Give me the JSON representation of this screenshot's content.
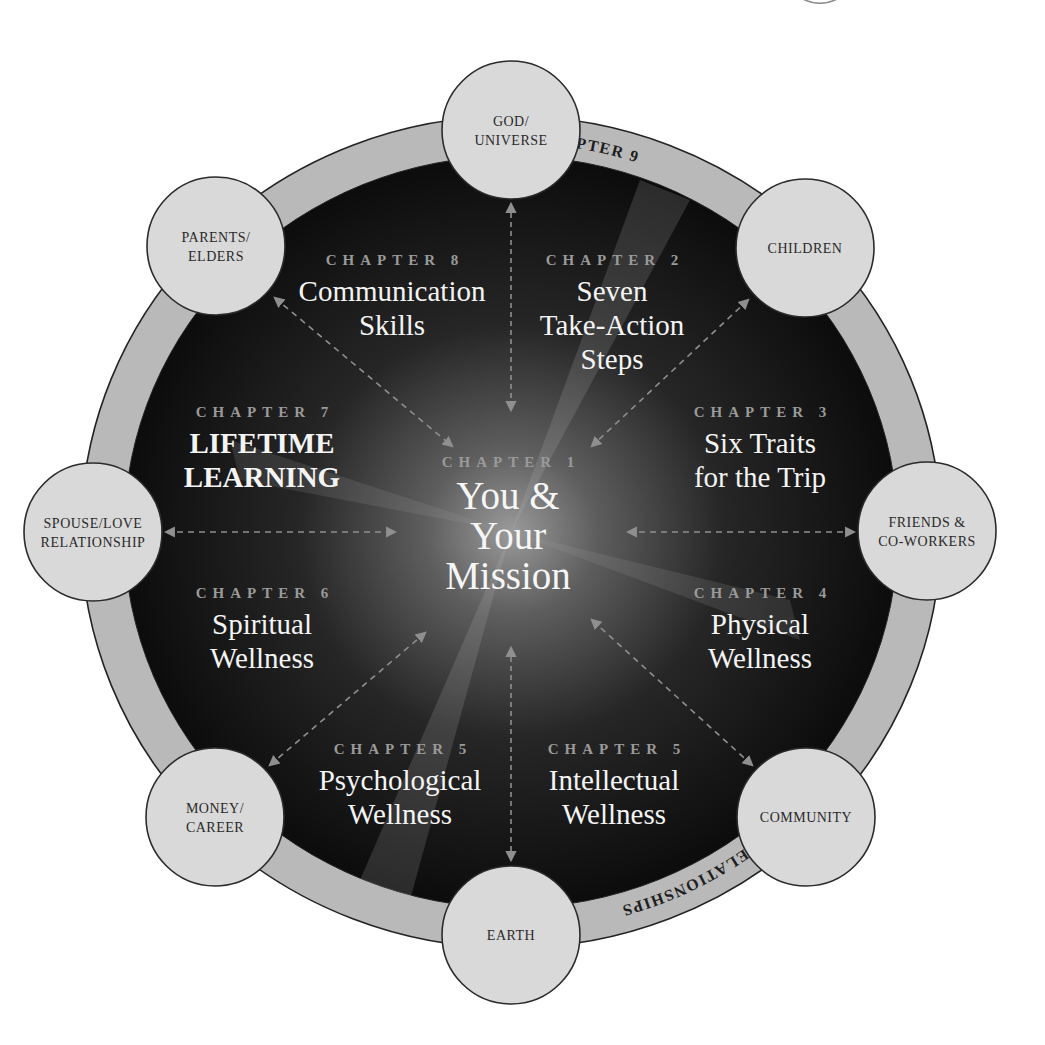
{
  "diagram": {
    "center": {
      "x": 511,
      "y": 532
    },
    "ring": {
      "outer_rx": 430,
      "outer_ry": 416,
      "inner_rx": 387,
      "inner_ry": 376
    },
    "colors": {
      "ring_fill": "#b9b9b9",
      "inner_dark": "#0e0e0e",
      "glow": "#8a8a8a",
      "node_fill": "#d9d9d9",
      "node_stroke": "#2b2b2b",
      "chapter_label": "#9a9a9a",
      "title_text": "#f4f4f4",
      "arrow": "#8f8f8f"
    },
    "arc_labels": [
      {
        "id": "arc-chapter-9",
        "text": "CHAPTER 9",
        "start_pct": "26%"
      },
      {
        "id": "arc-relationships",
        "text": "RELATIONSHIPS",
        "start_pct": "64.5%"
      }
    ],
    "nodes": [
      {
        "id": "god-universe",
        "lines": [
          "GOD/",
          "UNIVERSE"
        ],
        "x": 511,
        "y": 130
      },
      {
        "id": "children",
        "lines": [
          "CHILDREN"
        ],
        "x": 805,
        "y": 248
      },
      {
        "id": "friends-coworkers",
        "lines": [
          "FRIENDS &",
          "CO-WORKERS"
        ],
        "x": 927,
        "y": 531
      },
      {
        "id": "community",
        "lines": [
          "COMMUNITY"
        ],
        "x": 806,
        "y": 817
      },
      {
        "id": "earth",
        "lines": [
          "EARTH"
        ],
        "x": 511,
        "y": 935
      },
      {
        "id": "money-career",
        "lines": [
          "MONEY/",
          "CAREER"
        ],
        "x": 215,
        "y": 817
      },
      {
        "id": "spouse-love-relationship",
        "lines": [
          "SPOUSE/LOVE",
          "RELATIONSHIP"
        ],
        "x": 93,
        "y": 532
      },
      {
        "id": "parents-elders",
        "lines": [
          "PARENTS/",
          "ELDERS"
        ],
        "x": 216,
        "y": 246
      }
    ],
    "node_radius": 69,
    "chapters": [
      {
        "id": "chapter-8",
        "label": "CHAPTER 8",
        "lines": [
          "Communication",
          "Skills"
        ],
        "x": 392,
        "y": 265,
        "bold": false
      },
      {
        "id": "chapter-2",
        "label": "CHAPTER 2",
        "lines": [
          "Seven",
          "Take-Action",
          "Steps"
        ],
        "x": 612,
        "y": 265,
        "bold": false
      },
      {
        "id": "chapter-7",
        "label": "CHAPTER 7",
        "lines": [
          "LIFETIME",
          "LEARNING"
        ],
        "x": 262,
        "y": 417,
        "bold": true
      },
      {
        "id": "chapter-3",
        "label": "CHAPTER 3",
        "lines": [
          "Six Traits",
          "for the Trip"
        ],
        "x": 760,
        "y": 417,
        "bold": false
      },
      {
        "id": "chapter-6",
        "label": "CHAPTER 6",
        "lines": [
          "Spiritual",
          "Wellness"
        ],
        "x": 262,
        "y": 598,
        "bold": false
      },
      {
        "id": "chapter-4",
        "label": "CHAPTER 4",
        "lines": [
          "Physical",
          "Wellness"
        ],
        "x": 760,
        "y": 598,
        "bold": false
      },
      {
        "id": "chapter-5-psych",
        "label": "CHAPTER 5",
        "lines": [
          "Psychological",
          "Wellness"
        ],
        "x": 400,
        "y": 754,
        "bold": false
      },
      {
        "id": "chapter-5-intel",
        "label": "CHAPTER 5",
        "lines": [
          "Intellectual",
          "Wellness"
        ],
        "x": 614,
        "y": 754,
        "bold": false
      }
    ],
    "center_chapter": {
      "id": "chapter-1",
      "label": "CHAPTER 1",
      "lines": [
        "You &",
        "Your",
        "Mission"
      ],
      "x": 508,
      "y": 467
    },
    "arrows": [
      {
        "x1": 511,
        "y1": 204,
        "x2": 511,
        "y2": 410,
        "vert": true
      },
      {
        "x1": 511,
        "y1": 648,
        "x2": 511,
        "y2": 860,
        "vert": true
      },
      {
        "x1": 166,
        "y1": 532,
        "x2": 395,
        "y2": 532
      },
      {
        "x1": 628,
        "y1": 532,
        "x2": 854,
        "y2": 532
      },
      {
        "x1": 275,
        "y1": 298,
        "x2": 452,
        "y2": 446
      },
      {
        "x1": 748,
        "y1": 300,
        "x2": 592,
        "y2": 446
      },
      {
        "x1": 270,
        "y1": 765,
        "x2": 425,
        "y2": 633
      },
      {
        "x1": 752,
        "y1": 765,
        "x2": 592,
        "y2": 620
      }
    ]
  }
}
